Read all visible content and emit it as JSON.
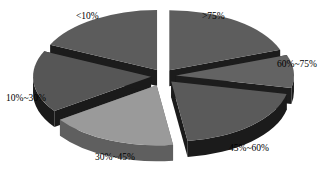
{
  "chart_data": {
    "type": "pie",
    "title": "",
    "subtitle": "",
    "xlabel": "",
    "ylabel": "",
    "legend_position": "none",
    "grid": false,
    "style": "3d-exploded",
    "categories": [
      "<10%",
      "10%~30%",
      "30%~45%",
      "45%~60%",
      "60%~75%",
      ">75%"
    ],
    "values": [
      18.0,
      16.5,
      17.5,
      19.5,
      9.0,
      19.5
    ],
    "slices": [
      {
        "label": "<10%",
        "value": 18.0,
        "start_angle": 205,
        "end_angle": 270,
        "top_color": "#5c5c5c",
        "side_color": "#1c1c1c",
        "explode": 11
      },
      {
        "label": "10%~30%",
        "value": 16.5,
        "start_angle": 145,
        "end_angle": 205,
        "top_color": "#565656",
        "side_color": "#1a1a1a",
        "explode": 12
      },
      {
        "label": "30%~45%",
        "value": 17.5,
        "start_angle": 82,
        "end_angle": 145,
        "top_color": "#9a9a9a",
        "side_color": "#5f5f5f",
        "explode": 16
      },
      {
        "label": "45%~60%",
        "value": 19.5,
        "start_angle": 12,
        "end_angle": 82,
        "top_color": "#5a5a5a",
        "side_color": "#1b1b1b",
        "explode": 12
      },
      {
        "label": "60%~75%",
        "value": 9.0,
        "start_angle": -20,
        "end_angle": 12,
        "top_color": "#636363",
        "side_color": "#1d1d1d",
        "explode": 13
      },
      {
        "label": ">75%",
        "value": 19.5,
        "start_angle": -90,
        "end_angle": -20,
        "top_color": "#5d5d5d",
        "side_color": "#1c1c1c",
        "explode": 11
      }
    ],
    "colors": {
      "background": "#ffffff",
      "label_text": "#000000",
      "dark_slice_top": "#5a5a5a",
      "light_slice_top": "#9a9a9a",
      "slice_side": "#1c1c1c"
    },
    "labels": {
      "lt10": "<10%",
      "r10_30": "10%~30%",
      "r30_45": "30%~45%",
      "r45_60": "45%~60%",
      "r60_75": "60%~75%",
      "gt75": ">75%"
    }
  }
}
